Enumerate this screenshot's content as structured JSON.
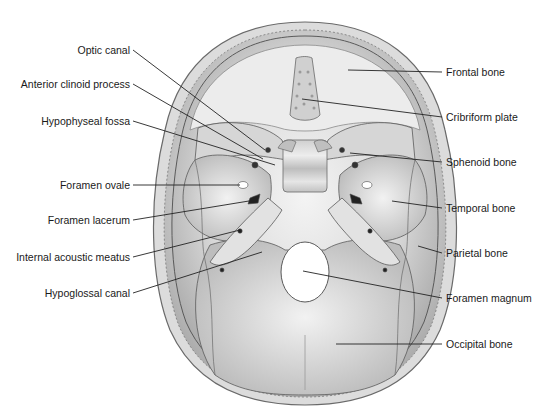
{
  "figure": {
    "colors": {
      "bone_light": "#e8e8e8",
      "bone_mid": "#c9c9c9",
      "bone_dark": "#9a9a9a",
      "outline": "#5a5a5a",
      "leader": "#222222",
      "text": "#1a1a1a"
    }
  },
  "labels_left": [
    {
      "text": "Optic canal",
      "x": 130,
      "y": 50,
      "target": [
        265,
        150
      ]
    },
    {
      "text": "Anterior clinoid process",
      "x": 130,
      "y": 84,
      "target": [
        263,
        159
      ]
    },
    {
      "text": "Hypophyseal fossa",
      "x": 130,
      "y": 121,
      "target": [
        275,
        165
      ]
    },
    {
      "text": "Foramen ovale",
      "x": 130,
      "y": 185,
      "target": [
        240,
        185
      ]
    },
    {
      "text": "Foramen lacerum",
      "x": 130,
      "y": 220,
      "target": [
        255,
        200
      ]
    },
    {
      "text": "Internal acoustic meatus",
      "x": 130,
      "y": 257,
      "target": [
        240,
        230
      ]
    },
    {
      "text": "Hypoglossal canal",
      "x": 130,
      "y": 293,
      "target": [
        262,
        252
      ]
    }
  ],
  "labels_right": [
    {
      "text": "Frontal bone",
      "x": 446,
      "y": 72,
      "target": [
        348,
        70
      ]
    },
    {
      "text": "Cribriform plate",
      "x": 446,
      "y": 117,
      "target": [
        302,
        99
      ]
    },
    {
      "text": "Sphenoid bone",
      "x": 446,
      "y": 162,
      "target": [
        350,
        153
      ]
    },
    {
      "text": "Temporal bone",
      "x": 446,
      "y": 208,
      "target": [
        392,
        201
      ]
    },
    {
      "text": "Parietal bone",
      "x": 446,
      "y": 253,
      "target": [
        418,
        246
      ]
    },
    {
      "text": "Foramen magnum",
      "x": 446,
      "y": 298,
      "target": [
        303,
        271
      ]
    },
    {
      "text": "Occipital bone",
      "x": 446,
      "y": 344,
      "target": [
        336,
        344
      ]
    }
  ]
}
